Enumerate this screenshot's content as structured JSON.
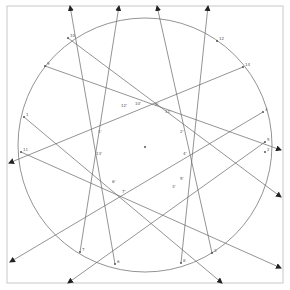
{
  "diagram": {
    "frame": {
      "x": 7,
      "y": 6,
      "w": 276,
      "h": 277,
      "color": "#c8c8c8"
    },
    "circle": {
      "cx": 145,
      "cy": 145,
      "r": 127,
      "color": "#777777"
    },
    "center": {
      "x": 145,
      "y": 147,
      "label": "O"
    },
    "points": [
      {
        "id": "p10",
        "x": 68,
        "y": 38,
        "label": "10"
      },
      {
        "id": "p9",
        "x": 45,
        "y": 66,
        "label": "9"
      },
      {
        "id": "p1",
        "x": 24,
        "y": 117,
        "label": "1"
      },
      {
        "id": "p11",
        "x": 21,
        "y": 152,
        "label": "11"
      },
      {
        "id": "p7",
        "x": 80,
        "y": 252,
        "label": "7"
      },
      {
        "id": "p6",
        "x": 115,
        "y": 264,
        "label": "6"
      },
      {
        "id": "p8",
        "x": 181,
        "y": 263,
        "label": "8"
      },
      {
        "id": "p3",
        "x": 212,
        "y": 253,
        "label": "3"
      },
      {
        "id": "p2",
        "x": 265,
        "y": 152,
        "label": "2"
      },
      {
        "id": "p5",
        "x": 265,
        "y": 142,
        "label": "5"
      },
      {
        "id": "p4",
        "x": 263,
        "y": 112,
        "label": "4"
      },
      {
        "id": "p14",
        "x": 243,
        "y": 67,
        "label": "14"
      },
      {
        "id": "p12",
        "x": 217,
        "y": 41,
        "label": "12"
      }
    ],
    "inner_labels": [
      {
        "x": 121,
        "y": 107,
        "label": "12'"
      },
      {
        "x": 135,
        "y": 105,
        "label": "10'"
      },
      {
        "x": 155,
        "y": 106,
        "label": "9'"
      },
      {
        "x": 165,
        "y": 113,
        "label": "11'"
      },
      {
        "x": 98,
        "y": 133,
        "label": "1'"
      },
      {
        "x": 96,
        "y": 155,
        "label": "13'"
      },
      {
        "x": 180,
        "y": 133,
        "label": "2'"
      },
      {
        "x": 183,
        "y": 155,
        "label": "4'"
      },
      {
        "x": 112,
        "y": 183,
        "label": "6'"
      },
      {
        "x": 122,
        "y": 193,
        "label": "7'"
      },
      {
        "x": 172,
        "y": 188,
        "label": "3'"
      },
      {
        "x": 180,
        "y": 180,
        "label": "5'"
      }
    ],
    "lines": [
      {
        "x1": 115,
        "y1": 264,
        "x2": 70,
        "y2": 6
      },
      {
        "x1": 80,
        "y1": 252,
        "x2": 119,
        "y2": 6
      },
      {
        "x1": 212,
        "y1": 253,
        "x2": 157,
        "y2": 6
      },
      {
        "x1": 181,
        "y1": 263,
        "x2": 208,
        "y2": 6
      },
      {
        "x1": 68,
        "y1": 38,
        "x2": 281,
        "y2": 197
      },
      {
        "x1": 45,
        "y1": 66,
        "x2": 281,
        "y2": 150
      },
      {
        "x1": 24,
        "y1": 117,
        "x2": 222,
        "y2": 283
      },
      {
        "x1": 21,
        "y1": 152,
        "x2": 281,
        "y2": 268
      },
      {
        "x1": 243,
        "y1": 67,
        "x2": 9,
        "y2": 163
      },
      {
        "x1": 263,
        "y1": 112,
        "x2": 10,
        "y2": 262
      },
      {
        "x1": 265,
        "y1": 142,
        "x2": 68,
        "y2": 283
      }
    ],
    "line_color": "#666666"
  }
}
